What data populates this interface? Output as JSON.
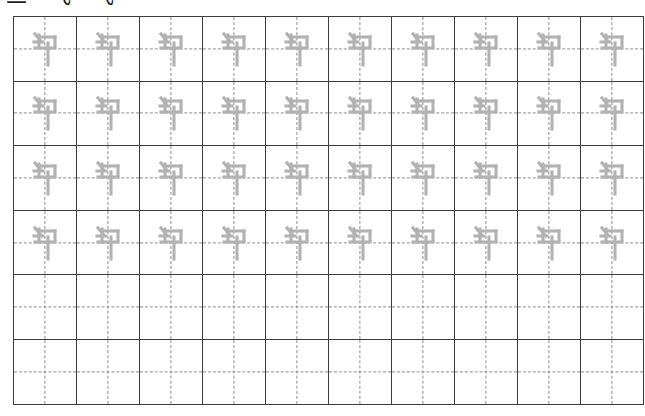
{
  "page": {
    "type": "chinese-character-handwriting-practice-worksheet",
    "background_color": "#ffffff",
    "width": 645,
    "height": 416
  },
  "header": {
    "visible": true,
    "clipped": true,
    "note": "only the bottom sliver of the heading text is visible at the top edge of the screenshot",
    "text": "二 飞 飞",
    "color": "#1d1d1d"
  },
  "grid": {
    "columns": 10,
    "rows": 6,
    "cell_width": 62,
    "cell_height": 64,
    "origin_x": 13,
    "origin_y": 16,
    "border_color": "#3d3d3d",
    "guide_color": "#8d8d8d",
    "guide_style": "dashed",
    "guides": [
      "vertical-center",
      "horizontal-center"
    ],
    "trace_color": "#b2b2b2",
    "character": "勺",
    "rows_data": [
      {
        "index": 1,
        "filled": true,
        "cells": [
          "勺",
          "勺",
          "勺",
          "勺",
          "勺",
          "勺",
          "勺",
          "勺",
          "勺",
          "勺"
        ]
      },
      {
        "index": 2,
        "filled": true,
        "cells": [
          "勺",
          "勺",
          "勺",
          "勺",
          "勺",
          "勺",
          "勺",
          "勺",
          "勺",
          "勺"
        ]
      },
      {
        "index": 3,
        "filled": true,
        "cells": [
          "勺",
          "勺",
          "勺",
          "勺",
          "勺",
          "勺",
          "勺",
          "勺",
          "勺",
          "勺"
        ]
      },
      {
        "index": 4,
        "filled": true,
        "cells": [
          "勺",
          "勺",
          "勺",
          "勺",
          "勺",
          "勺",
          "勺",
          "勺",
          "勺",
          "勺"
        ]
      },
      {
        "index": 5,
        "filled": false,
        "cells": [
          "",
          "",
          "",
          "",
          "",
          "",
          "",
          "",
          "",
          ""
        ]
      },
      {
        "index": 6,
        "filled": false,
        "cells": [
          "",
          "",
          "",
          "",
          "",
          "",
          "",
          "",
          "",
          ""
        ]
      }
    ]
  }
}
